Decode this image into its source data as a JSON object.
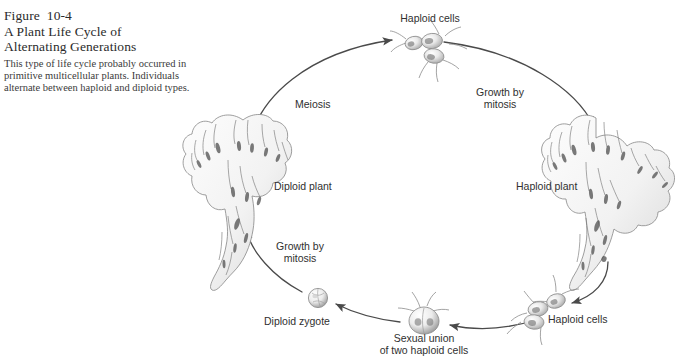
{
  "figure": {
    "label": "Figure  10-4",
    "title_line1": "A Plant Life Cycle of",
    "title_line2": "Alternating Generations",
    "body": "This type of life cycle probably occurred in primitive multicellular plants. Individuals alternate between haploid and diploid types."
  },
  "diagram": {
    "type": "life-cycle",
    "labels": {
      "haploid_cells_top": "Haploid cells",
      "growth_by_mitosis_right_l1": "Growth by",
      "growth_by_mitosis_right_l2": "mitosis",
      "meiosis": "Meiosis",
      "diploid_plant": "Diploid plant",
      "haploid_plant": "Haploid plant",
      "growth_by_mitosis_left_l1": "Growth by",
      "growth_by_mitosis_left_l2": "mitosis",
      "diploid_zygote": "Diploid zygote",
      "sexual_union_l1": "Sexual union",
      "sexual_union_l2": "of two haploid cells",
      "haploid_cells_bottom": "Haploid cells"
    },
    "colors": {
      "arrow": "#4a4a4a",
      "text": "#303030",
      "title": "#2b2b2b",
      "body": "#3a3a3a",
      "background": "#ffffff",
      "illustration_ink": "#6e6e6e"
    },
    "stages": [
      "Diploid plant",
      "Haploid cells (after meiosis)",
      "Haploid plant",
      "Haploid cells",
      "Sexual union of two haploid cells",
      "Diploid zygote"
    ],
    "transitions": [
      "Meiosis",
      "Growth by mitosis",
      "Growth by mitosis"
    ]
  }
}
